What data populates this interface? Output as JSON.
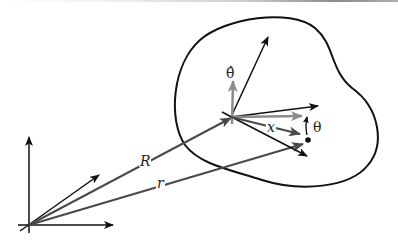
{
  "diagram": {
    "type": "rigid-body position vectors",
    "labels": {
      "R": "R",
      "r": "r",
      "x": "x",
      "theta": "θ",
      "theta_hat": "θ̂"
    },
    "colors": {
      "black": "#111111",
      "dark_grey": "#4a4a4a",
      "light_grey": "#8c8c8c"
    },
    "elements": [
      {
        "name": "fixed-frame-axes",
        "origin": [
          29,
          225
        ]
      },
      {
        "name": "R-vector",
        "from": [
          29,
          225
        ],
        "to": [
          230,
          118
        ]
      },
      {
        "name": "r-vector",
        "from": [
          29,
          225
        ],
        "to": [
          303,
          145
        ]
      },
      {
        "name": "body-outline",
        "shape": "closed blob"
      },
      {
        "name": "body-frame-axes",
        "origin": [
          230,
          118
        ]
      },
      {
        "name": "theta-hat-vector",
        "from": [
          230,
          118
        ],
        "to": [
          233,
          80
        ]
      },
      {
        "name": "x-vector",
        "from": [
          230,
          118
        ],
        "to": [
          302,
          134
        ]
      },
      {
        "name": "point-mass",
        "at": [
          308,
          140
        ]
      },
      {
        "name": "theta-angle-arrow"
      }
    ]
  }
}
